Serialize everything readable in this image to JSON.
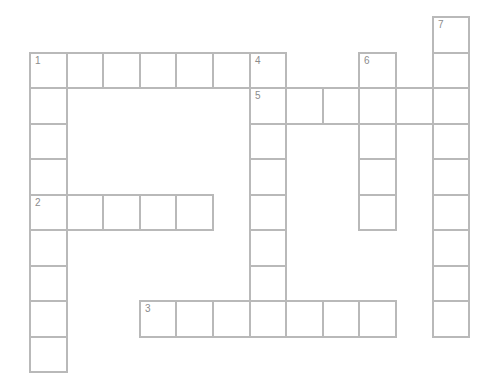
{
  "puzzle": {
    "type": "crossword",
    "grid": {
      "origin_x": 29,
      "origin_y": 16,
      "col_pitch": 36.6,
      "row_pitch": 35.5,
      "line_color": "#b9b9b9",
      "number_color": "#8c8c8c"
    },
    "entries": [
      {
        "number": "1",
        "direction": "across",
        "row": 1,
        "col": 0,
        "length": 7
      },
      {
        "number": "1",
        "direction": "down",
        "row": 1,
        "col": 0,
        "length": 9
      },
      {
        "number": "2",
        "direction": "across",
        "row": 5,
        "col": 0,
        "length": 5
      },
      {
        "number": "3",
        "direction": "across",
        "row": 8,
        "col": 3,
        "length": 7
      },
      {
        "number": "4",
        "direction": "down",
        "row": 1,
        "col": 6,
        "length": 8
      },
      {
        "number": "5",
        "direction": "across",
        "row": 2,
        "col": 6,
        "length": 6
      },
      {
        "number": "6",
        "direction": "down",
        "row": 1,
        "col": 9,
        "length": 5
      },
      {
        "number": "7",
        "direction": "down",
        "row": 0,
        "col": 11,
        "length": 9
      }
    ]
  }
}
